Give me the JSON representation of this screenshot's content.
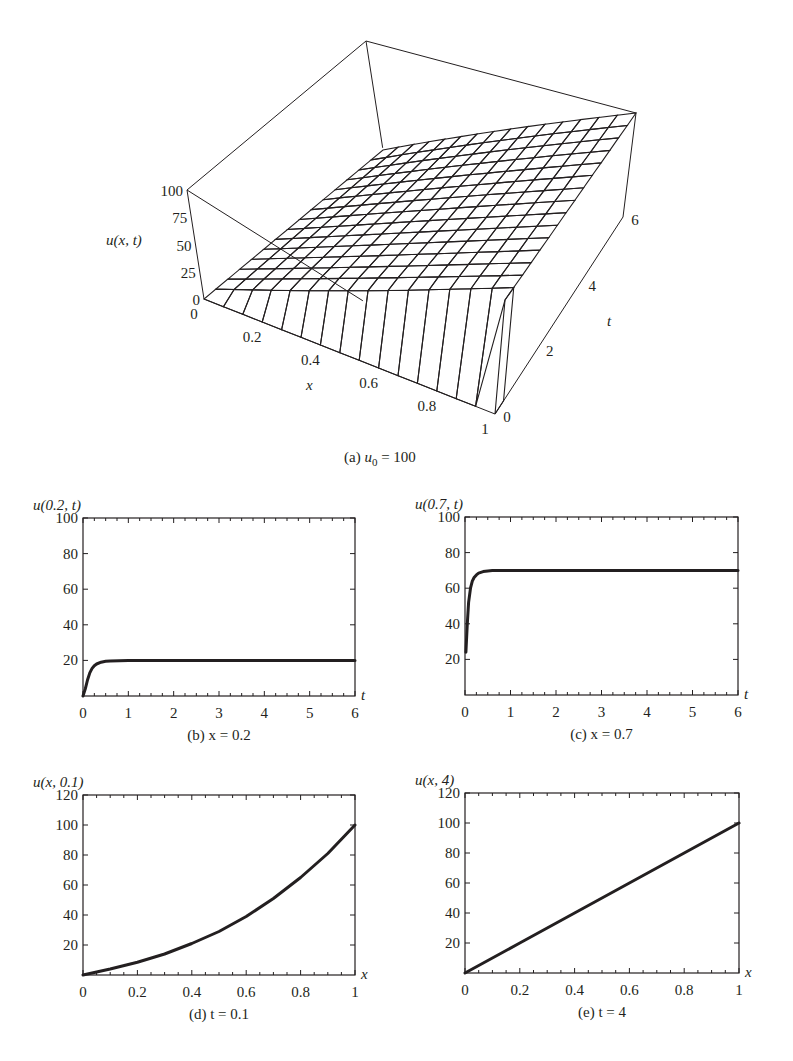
{
  "figure": {
    "colors": {
      "ink": "#231f20",
      "surface_light": "#f2f2f2",
      "surface_dark": "#d6d6d6",
      "background": "#ffffff"
    }
  },
  "chart_data": [
    {
      "id": "a",
      "type": "surface3d",
      "caption_prefix": "(a) ",
      "caption_var": "u",
      "caption_sub": "0",
      "caption_rest": " = 100",
      "zlabel": "u(x, t)",
      "xlabel": "x",
      "ylabel": "t",
      "zticks": [
        "0",
        "25",
        "50",
        "75",
        "100"
      ],
      "xticks": [
        "0",
        "0.2",
        "0.4",
        "0.6",
        "0.8",
        "1"
      ],
      "tticks": [
        "0",
        "2",
        "4",
        "6"
      ],
      "xlim": [
        0,
        1
      ],
      "tlim": [
        0,
        6
      ],
      "zlim": [
        0,
        100
      ],
      "grid": {
        "nx": 15,
        "nt": 15
      },
      "description": "Solution surface of heat equation u_t = u_xx with u(x,0)=0, u(0,t)=0, u(1,t)=u0=100; surface approaches steady state u = 100x"
    },
    {
      "id": "b",
      "type": "line",
      "title": "u(0.2, t)",
      "caption": "(b) x = 0.2",
      "xlabel": "t",
      "ylabel": "u(0.2, t)",
      "xlim": [
        0,
        6
      ],
      "ylim": [
        0,
        100
      ],
      "xticks": [
        0,
        1,
        2,
        3,
        4,
        5,
        6
      ],
      "yticks": [
        20,
        40,
        60,
        80,
        100
      ],
      "series": [
        {
          "name": "u(0.2,t)",
          "x": [
            0,
            0.05,
            0.1,
            0.15,
            0.2,
            0.25,
            0.3,
            0.4,
            0.5,
            0.6,
            1,
            2,
            3,
            4,
            5,
            6
          ],
          "y": [
            0,
            4,
            9,
            13,
            15.5,
            17,
            18,
            19,
            19.5,
            19.7,
            20,
            20,
            20,
            20,
            20,
            20
          ]
        }
      ]
    },
    {
      "id": "c",
      "type": "line",
      "title": "u(0.7, t)",
      "caption": "(c) x = 0.7",
      "xlabel": "t",
      "ylabel": "u(0.7, t)",
      "xlim": [
        0,
        6
      ],
      "ylim": [
        0,
        100
      ],
      "xticks": [
        0,
        1,
        2,
        3,
        4,
        5,
        6
      ],
      "yticks": [
        20,
        40,
        60,
        80,
        100
      ],
      "series": [
        {
          "name": "u(0.7,t)",
          "x": [
            0.02,
            0.05,
            0.08,
            0.12,
            0.16,
            0.2,
            0.25,
            0.3,
            0.4,
            0.5,
            0.6,
            1,
            2,
            3,
            4,
            5,
            6
          ],
          "y": [
            24,
            40,
            52,
            60,
            64,
            66,
            67.5,
            68.5,
            69.3,
            69.7,
            69.9,
            70,
            70,
            70,
            70,
            70,
            70
          ]
        }
      ]
    },
    {
      "id": "d",
      "type": "line",
      "title": "u(x, 0.1)",
      "caption": "(d) t = 0.1",
      "xlabel": "x",
      "ylabel": "u(x, 0.1)",
      "xlim": [
        0,
        1
      ],
      "ylim": [
        0,
        120
      ],
      "xticks": [
        0,
        0.2,
        0.4,
        0.6,
        0.8,
        1
      ],
      "yticks": [
        20,
        40,
        60,
        80,
        100,
        120
      ],
      "series": [
        {
          "name": "u(x,0.1)",
          "x": [
            0,
            0.1,
            0.2,
            0.3,
            0.4,
            0.5,
            0.6,
            0.7,
            0.8,
            0.9,
            1.0
          ],
          "y": [
            0,
            4,
            8.5,
            14,
            21,
            29,
            39,
            51,
            65,
            81,
            100
          ]
        }
      ]
    },
    {
      "id": "e",
      "type": "line",
      "title": "u(x, 4)",
      "caption": "(e) t = 4",
      "xlabel": "x",
      "ylabel": "u(x, 4)",
      "xlim": [
        0,
        1
      ],
      "ylim": [
        0,
        120
      ],
      "xticks": [
        0,
        0.2,
        0.4,
        0.6,
        0.8,
        1
      ],
      "yticks": [
        20,
        40,
        60,
        80,
        100,
        120
      ],
      "series": [
        {
          "name": "u(x,4)",
          "x": [
            0,
            0.2,
            0.4,
            0.6,
            0.8,
            1.0
          ],
          "y": [
            0,
            20,
            40,
            60,
            80,
            100
          ]
        }
      ]
    }
  ]
}
